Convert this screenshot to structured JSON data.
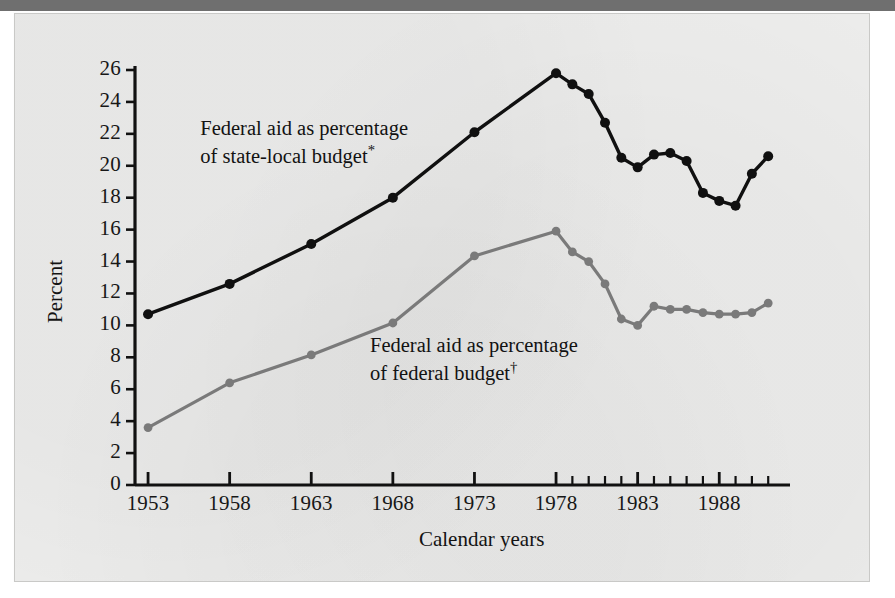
{
  "figure": {
    "kind": "printed-line-chart",
    "background_color": "#ececeb",
    "panel_border_color": "#c9c9c7"
  },
  "axes": {
    "y_title": "Percent",
    "x_title": "Calendar years",
    "y_tick_labels": [
      "0",
      "2",
      "4",
      "6",
      "8",
      "10",
      "12",
      "14",
      "16",
      "18",
      "20",
      "22",
      "24",
      "26"
    ],
    "x_tick_labels": [
      "1953",
      "1958",
      "1963",
      "1968",
      "1973",
      "1978",
      "1983",
      "1988"
    ]
  },
  "annotations": [
    {
      "name": "state-local-series-label",
      "line1": "Federal aid as percentage",
      "line2": "of state-local budget",
      "marker": "*",
      "color": "#121212"
    },
    {
      "name": "federal-series-label",
      "line1": "Federal aid as percentage",
      "line2": "of federal budget",
      "marker": "†",
      "color": "#121212"
    }
  ],
  "chart_data": {
    "type": "line",
    "title": "",
    "xlabel": "Calendar years",
    "ylabel": "Percent",
    "xlim": [
      1952.2,
      1991.6
    ],
    "ylim": [
      0,
      26
    ],
    "ytick_step": 2,
    "xtick_major_step": 5,
    "xtick_minor_step": 1,
    "grid": false,
    "legend": "inline-annotations",
    "series": [
      {
        "name": "Federal aid as percentage of state-local budget*",
        "color": "#101010",
        "marker": "filled-circle",
        "linewidth": 3.4,
        "x": [
          1953,
          1958,
          1963,
          1968,
          1973,
          1978,
          1979,
          1980,
          1981,
          1982,
          1983,
          1984,
          1985,
          1986,
          1987,
          1988,
          1989,
          1990,
          1991
        ],
        "y": [
          10.7,
          12.6,
          15.1,
          18.0,
          22.1,
          25.8,
          25.1,
          24.5,
          22.7,
          20.5,
          19.9,
          20.7,
          20.8,
          20.3,
          18.3,
          17.8,
          17.5,
          19.5,
          20.6
        ]
      },
      {
        "name": "Federal aid as percentage of federal budget†",
        "color": "#7a7a7a",
        "marker": "filled-circle",
        "linewidth": 3.2,
        "x": [
          1953,
          1958,
          1963,
          1968,
          1973,
          1978,
          1979,
          1980,
          1981,
          1982,
          1983,
          1984,
          1985,
          1986,
          1987,
          1988,
          1989,
          1990,
          1991
        ],
        "y": [
          3.6,
          6.4,
          8.15,
          10.15,
          14.35,
          15.9,
          14.6,
          14.0,
          12.6,
          10.4,
          10.0,
          11.2,
          11.0,
          11.0,
          10.8,
          10.7,
          10.7,
          10.8,
          11.4
        ]
      }
    ]
  }
}
